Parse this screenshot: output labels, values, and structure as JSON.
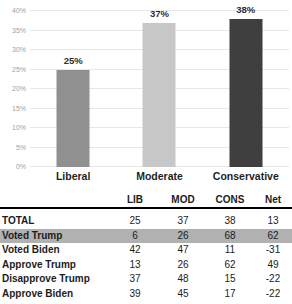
{
  "chart_data": {
    "type": "bar",
    "title": "",
    "xlabel": "",
    "ylabel": "",
    "categories": [
      "Liberal",
      "Moderate",
      "Conservative"
    ],
    "values": [
      25,
      37,
      38
    ],
    "value_labels": [
      "25%",
      "37%",
      "38%"
    ],
    "bar_colors": [
      "#909090",
      "#c7c7c7",
      "#3f3f3f"
    ],
    "ylim": [
      0,
      40
    ],
    "ytick_step": 5,
    "ytick_labels": [
      "0%",
      "5%",
      "10%",
      "15%",
      "20%",
      "25%",
      "30%",
      "35%",
      "40%"
    ],
    "grid": true,
    "legend": false,
    "gridline_color": "#e7e7e7"
  },
  "table": {
    "columns": [
      "",
      "LIB",
      "MOD",
      "CONS",
      "Net"
    ],
    "rows": [
      {
        "label": "TOTAL",
        "values": [
          "25",
          "37",
          "38",
          "13"
        ],
        "highlight": false
      },
      {
        "label": "Voted Trump",
        "values": [
          "6",
          "26",
          "68",
          "62"
        ],
        "highlight": true
      },
      {
        "label": "Voted Biden",
        "values": [
          "42",
          "47",
          "11",
          "-31"
        ],
        "highlight": false
      },
      {
        "label": "Approve Trump",
        "values": [
          "13",
          "26",
          "62",
          "49"
        ],
        "highlight": false
      },
      {
        "label": "Disapprove Trump",
        "values": [
          "37",
          "48",
          "15",
          "-22"
        ],
        "highlight": false
      },
      {
        "label": "Approve Biden",
        "values": [
          "39",
          "45",
          "17",
          "-22"
        ],
        "highlight": false
      }
    ],
    "highlight_color": "#b1b1b1"
  }
}
